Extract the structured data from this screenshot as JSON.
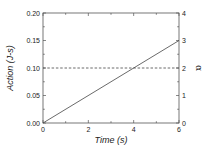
{
  "chart_data": {
    "type": "line",
    "title": "",
    "xlabel": "Time (s)",
    "ylabel": "Action (J-s)",
    "y2label": "α",
    "xlim": [
      0,
      6
    ],
    "ylim": [
      0,
      0.2
    ],
    "y2lim": [
      0,
      4
    ],
    "xticks": [
      "0",
      "2",
      "4",
      "6"
    ],
    "yticks": [
      "0.00",
      "0.05",
      "0.10",
      "0.15",
      "0.20"
    ],
    "y2ticks": [
      "0",
      "1",
      "2",
      "3",
      "4"
    ],
    "grid": false,
    "legend": null,
    "series": [
      {
        "name": "Action",
        "axis": "left",
        "style": "solid",
        "x": [
          0,
          6
        ],
        "y": [
          0.0,
          0.15
        ]
      },
      {
        "name": "α",
        "axis": "right",
        "style": "dashed",
        "x": [
          0,
          6
        ],
        "y": [
          2,
          2
        ]
      }
    ]
  }
}
